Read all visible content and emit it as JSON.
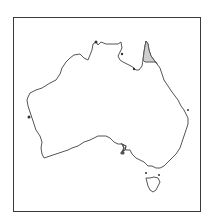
{
  "map": {
    "subject": "Australia outline",
    "highlighted_region": "Cape York Peninsula (north Queensland)",
    "colors": {
      "outline": "#555555",
      "highlight_fill": "#cfcfcf",
      "land_fill": "#ffffff",
      "frame": "#3a3a3a",
      "background": "#ffffff"
    }
  }
}
